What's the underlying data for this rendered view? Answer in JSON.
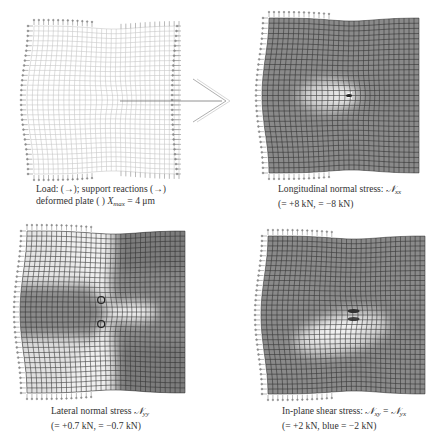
{
  "figure": {
    "panels": [
      {
        "id": "deformed-plate",
        "shading": "none",
        "caption_line1": "Load: (→); support reactions (→)",
        "caption_line2_prefix": "deformed plate (  ) ",
        "caption_line2_symbol": "X",
        "caption_line2_sub": "max",
        "caption_line2_suffix": " = 4 μm"
      },
      {
        "id": "longitudinal-stress",
        "shading": "longitudinal",
        "caption_line1_prefix": "Longitudinal normal stress: ",
        "caption_line1_symbol": "𝒩",
        "caption_line1_sub": "xx",
        "caption_line2": "(= +8 kN, = −8 kN)"
      },
      {
        "id": "lateral-stress",
        "shading": "lateral",
        "caption_line1_prefix": "Lateral normal stress ",
        "caption_line1_symbol": "𝒩",
        "caption_line1_sub": "yy",
        "caption_line2": "(= +0.7 kN, = −0.7 kN)"
      },
      {
        "id": "shear-stress",
        "shading": "shear",
        "caption_line1_prefix": "In-plane shear stress: ",
        "caption_line1_symbol": "𝒩",
        "caption_line1_sub": "xy",
        "caption_line1_eq": " = ",
        "caption_line1_symbol2": "𝒩",
        "caption_line1_sub2": "yx",
        "caption_line2": "(= +2 kN, blue = −2 kN)"
      }
    ],
    "arrow_icon": "open-arrow-right",
    "colors": {
      "mesh_light": "#bdbdbd",
      "mesh_dark": "#2e2e2e",
      "field_base": "#8a8a8a",
      "field_light": "#f2f2f2",
      "load_arrows": "#8c8c8c"
    }
  }
}
